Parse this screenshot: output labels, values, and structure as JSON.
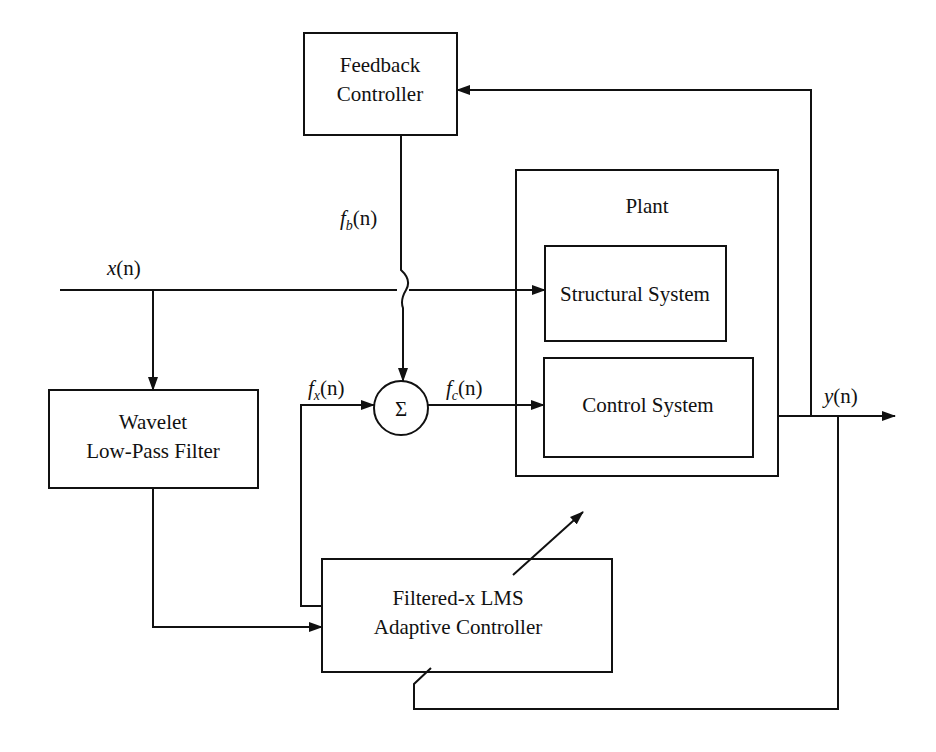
{
  "diagram": {
    "blocks": {
      "feedback_controller": {
        "line1": "Feedback",
        "line2": "Controller"
      },
      "plant": {
        "title": "Plant"
      },
      "structural_system": {
        "label": "Structural System"
      },
      "control_system": {
        "label": "Control System"
      },
      "wavelet_filter": {
        "line1": "Wavelet",
        "line2": "Low-Pass Filter"
      },
      "adaptive_controller": {
        "line1": "Filtered-x LMS",
        "line2": "Adaptive Controller"
      },
      "summer": {
        "symbol": "Σ"
      }
    },
    "signals": {
      "x": {
        "base": "x",
        "arg": "(n)"
      },
      "y": {
        "base": "y",
        "arg": "(n)"
      },
      "fb": {
        "base": "f",
        "sub": "b",
        "arg": "(n)"
      },
      "fx": {
        "base": "f",
        "sub": "x",
        "arg": "(n)"
      },
      "fc": {
        "base": "f",
        "sub": "c",
        "arg": "(n)"
      }
    }
  }
}
